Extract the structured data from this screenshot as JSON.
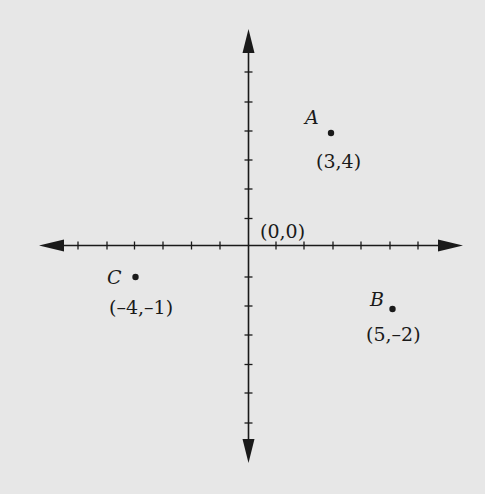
{
  "diagram": {
    "type": "coordinate-plane",
    "background": "#e7e7e7",
    "ink": "#1a1a1a",
    "origin_label": "(0,0)",
    "x_ticks_each_side": 6,
    "y_ticks_each_side": 6,
    "points": [
      {
        "name": "A",
        "x": 3,
        "y": 4,
        "coord_label": "(3,4)"
      },
      {
        "name": "B",
        "x": 5,
        "y": -2,
        "coord_label": "(5,–2)"
      },
      {
        "name": "C",
        "x": -4,
        "y": -1,
        "coord_label": "(–4,–1)"
      }
    ]
  }
}
